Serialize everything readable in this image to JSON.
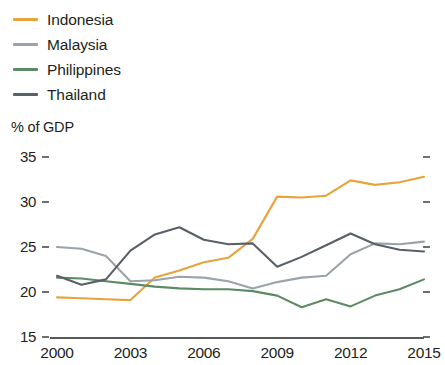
{
  "legend": {
    "items": [
      {
        "label": "Indonesia",
        "color": "#e8a33d",
        "icon": "line-swatch-icon"
      },
      {
        "label": "Malaysia",
        "color": "#9ba3aa",
        "icon": "line-swatch-icon"
      },
      {
        "label": "Philippines",
        "color": "#5b8a66",
        "icon": "line-swatch-icon"
      },
      {
        "label": "Thailand",
        "color": "#5a6068",
        "icon": "line-swatch-icon"
      }
    ]
  },
  "axis_title": "% of GDP",
  "chart_data": {
    "type": "line",
    "title": "",
    "subtitle": "",
    "xlabel": "",
    "ylabel": "% of GDP",
    "ylim": [
      15,
      35
    ],
    "xlim": [
      2000,
      2015
    ],
    "yticks": [
      15,
      20,
      25,
      30,
      35
    ],
    "xticks": [
      2000,
      2003,
      2006,
      2009,
      2012,
      2015
    ],
    "grid": false,
    "legend_position": "top-left",
    "x": [
      2000,
      2001,
      2002,
      2003,
      2004,
      2005,
      2006,
      2007,
      2008,
      2009,
      2010,
      2011,
      2012,
      2013,
      2014,
      2015
    ],
    "series": [
      {
        "name": "Indonesia",
        "color": "#e8a33d",
        "values": [
          19.4,
          19.3,
          19.2,
          19.1,
          21.6,
          22.4,
          23.3,
          23.8,
          25.9,
          30.6,
          30.5,
          30.7,
          32.4,
          31.9,
          32.2,
          32.8
        ]
      },
      {
        "name": "Malaysia",
        "color": "#9ba3aa",
        "values": [
          25.0,
          24.8,
          24.0,
          21.2,
          21.3,
          21.7,
          21.6,
          21.2,
          20.4,
          21.1,
          21.6,
          21.8,
          24.2,
          25.4,
          25.3,
          25.6
        ]
      },
      {
        "name": "Philippines",
        "color": "#5b8a66",
        "values": [
          21.6,
          21.5,
          21.2,
          20.9,
          20.6,
          20.4,
          20.3,
          20.3,
          20.1,
          19.6,
          18.3,
          19.2,
          18.4,
          19.6,
          20.3,
          21.4
        ]
      },
      {
        "name": "Thailand",
        "color": "#5a6068",
        "values": [
          21.8,
          20.8,
          21.4,
          24.6,
          26.4,
          27.2,
          25.8,
          25.3,
          25.4,
          22.8,
          23.9,
          25.2,
          26.5,
          25.3,
          24.7,
          24.5
        ]
      }
    ]
  }
}
